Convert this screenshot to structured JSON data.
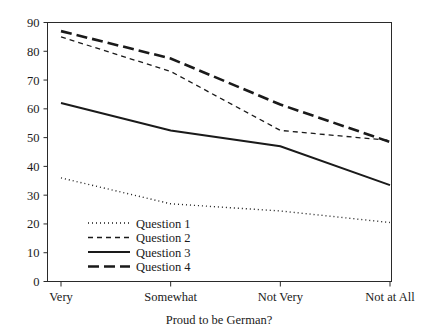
{
  "chart_data": {
    "type": "line",
    "title": "",
    "subtitle": "",
    "xlabel": "Proud to be German?",
    "ylabel": "",
    "categories": [
      "Very",
      "Somewhat",
      "Not Very",
      "Not at All"
    ],
    "series": [
      {
        "name": "Question 1",
        "values": [
          36,
          27,
          24.5,
          20.5
        ],
        "style": "dotted"
      },
      {
        "name": "Question 2",
        "values": [
          85,
          73,
          52.5,
          49
        ],
        "style": "short-dash"
      },
      {
        "name": "Question 3",
        "values": [
          62,
          52.5,
          47,
          33.5
        ],
        "style": "solid"
      },
      {
        "name": "Question 4",
        "values": [
          87,
          77.5,
          61.5,
          48.5
        ],
        "style": "long-dash"
      }
    ],
    "ylim": [
      0,
      90
    ],
    "ytick_labels": [
      "0",
      "10",
      "20",
      "30",
      "40",
      "50",
      "60",
      "70",
      "80",
      "90"
    ],
    "ytick_values": [
      0,
      10,
      20,
      30,
      40,
      50,
      60,
      70,
      80,
      90
    ],
    "grid": false,
    "legend_position": "inside-lower-left",
    "line_color": "#1a1a1a",
    "axis_color": "#2a2a2a",
    "background": "#ffffff"
  },
  "legend": {
    "entries": [
      {
        "label": "Question 1"
      },
      {
        "label": "Question 2"
      },
      {
        "label": "Question 3"
      },
      {
        "label": "Question 4"
      }
    ]
  },
  "axes": {
    "x_title": "Proud to be German?",
    "x_categories": [
      "Very",
      "Somewhat",
      "Not Very",
      "Not at All"
    ],
    "y_ticks": [
      "90",
      "80",
      "70",
      "60",
      "50",
      "40",
      "30",
      "20",
      "10",
      "0"
    ]
  }
}
